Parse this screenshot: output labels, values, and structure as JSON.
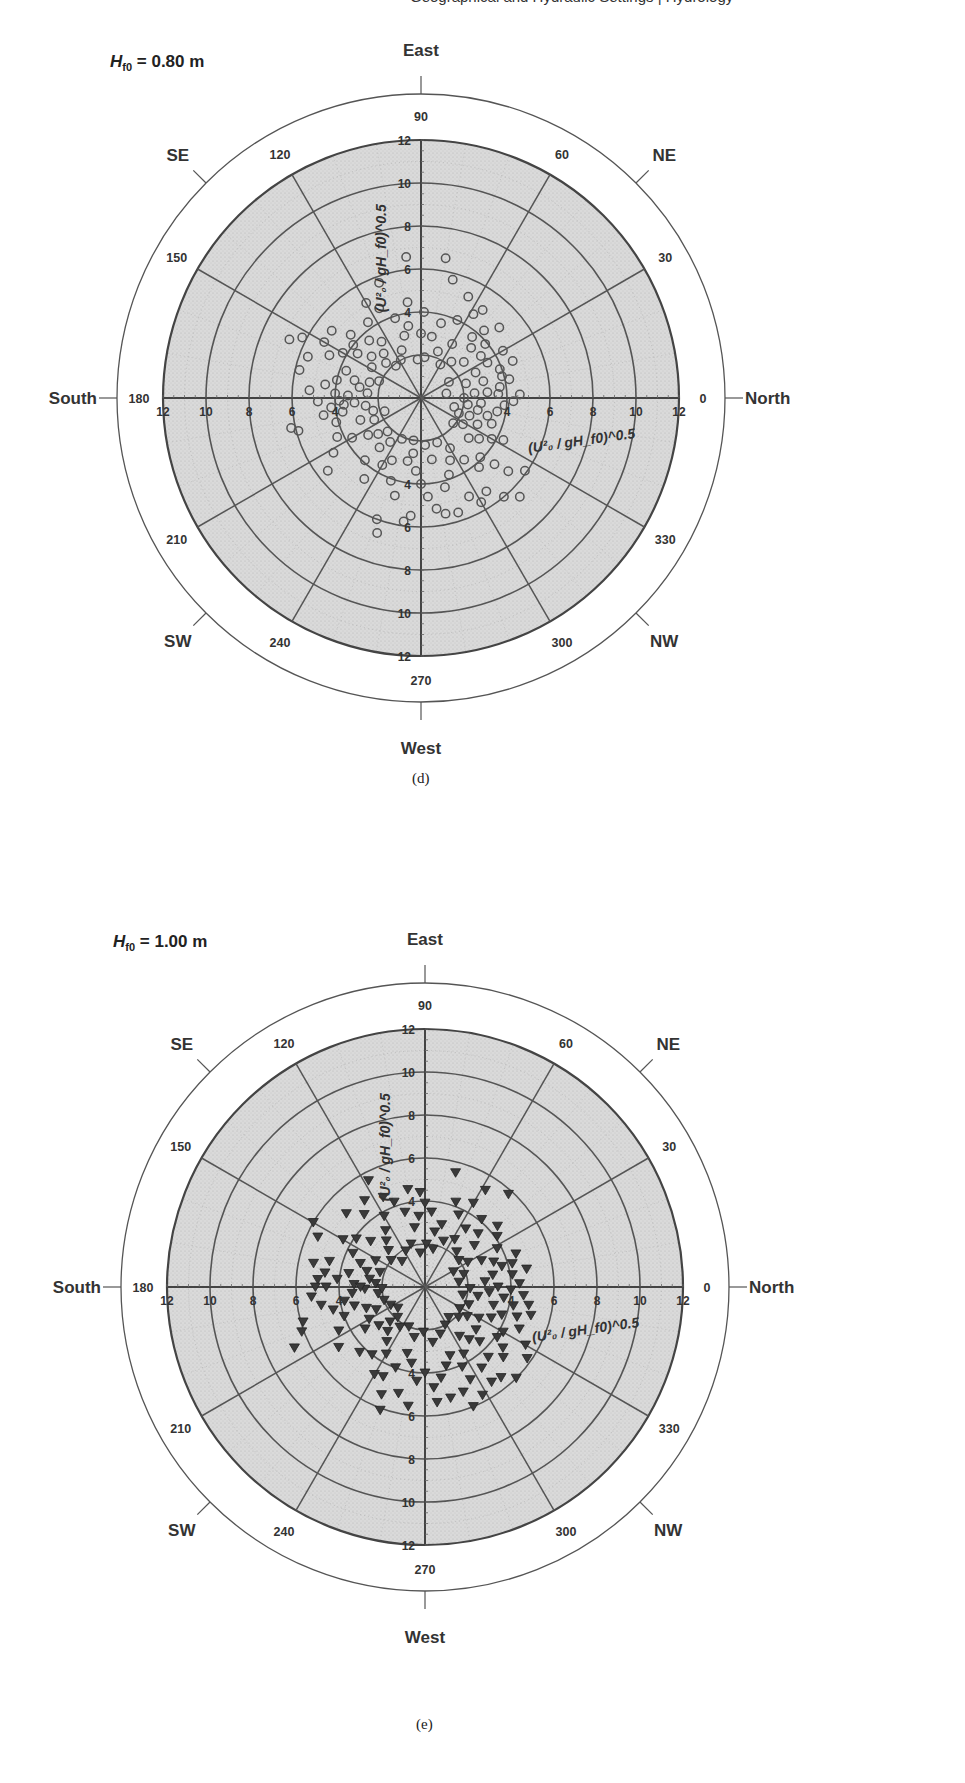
{
  "page": {
    "header_fragment": "Geographical and Hydraulic Settings | Hydrology"
  },
  "chart_data": [
    {
      "type": "scatter",
      "subtype": "polar",
      "panel_label": "(d)",
      "title": "H_f0 = 0.80 m",
      "title_parts": {
        "symbol": "H",
        "subscript": "f0",
        "rest": " = 0.80 m"
      },
      "radial_axis_label": "(U²₀ / gH_f0)^0.5",
      "radial_ticks": [
        2,
        4,
        6,
        8,
        10,
        12
      ],
      "radial_tick_labels_shown": [
        "4",
        "6",
        "8",
        "10",
        "12"
      ],
      "rlim": [
        0,
        12
      ],
      "angle_ticks": [
        0,
        30,
        60,
        90,
        120,
        150,
        180,
        210,
        240,
        270,
        300,
        330
      ],
      "compass": {
        "0": "North",
        "45": "NE",
        "90": "East",
        "135": "SE",
        "180": "South",
        "225": "SW",
        "270": "West",
        "315": "NW"
      },
      "marker": "open-circle",
      "marker_color": "#555555",
      "grid": true,
      "points": [
        [
          12,
          4.2
        ],
        [
          20,
          3.9
        ],
        [
          8,
          3.7
        ],
        [
          28,
          3.5
        ],
        [
          35,
          3.4
        ],
        [
          45,
          3.3
        ],
        [
          3,
          3.6
        ],
        [
          15,
          3.0
        ],
        [
          25,
          2.8
        ],
        [
          5,
          2.5
        ],
        [
          40,
          2.6
        ],
        [
          50,
          2.2
        ],
        [
          60,
          1.8
        ],
        [
          30,
          1.5
        ],
        [
          10,
          1.2
        ],
        [
          18,
          2.2
        ],
        [
          55,
          5.0
        ],
        [
          47,
          4.3
        ],
        [
          58,
          4.6
        ],
        [
          65,
          5.2
        ],
        [
          75,
          3.6
        ],
        [
          80,
          2.9
        ],
        [
          70,
          2.3
        ],
        [
          85,
          1.9
        ],
        [
          95,
          1.8
        ],
        [
          90,
          3.0
        ],
        [
          100,
          3.4
        ],
        [
          108,
          3.9
        ],
        [
          115,
          4.6
        ],
        [
          120,
          5.1
        ],
        [
          125,
          3.2
        ],
        [
          130,
          2.7
        ],
        [
          88,
          4.0
        ],
        [
          98,
          4.5
        ],
        [
          105,
          3.0
        ],
        [
          112,
          2.4
        ],
        [
          118,
          2.0
        ],
        [
          128,
          1.9
        ],
        [
          135,
          2.3
        ],
        [
          140,
          3.0
        ],
        [
          145,
          3.6
        ],
        [
          150,
          4.2
        ],
        [
          155,
          4.7
        ],
        [
          160,
          3.7
        ],
        [
          165,
          3.2
        ],
        [
          170,
          2.9
        ],
        [
          175,
          2.5
        ],
        [
          178,
          3.4
        ],
        [
          132,
          3.6
        ],
        [
          138,
          4.4
        ],
        [
          143,
          5.2
        ],
        [
          148,
          2.7
        ],
        [
          158,
          2.1
        ],
        [
          163,
          2.5
        ],
        [
          168,
          4.0
        ],
        [
          172,
          4.5
        ],
        [
          176,
          5.2
        ],
        [
          182,
          4.8
        ],
        [
          186,
          4.2
        ],
        [
          190,
          3.7
        ],
        [
          184,
          3.1
        ],
        [
          188,
          2.6
        ],
        [
          195,
          2.3
        ],
        [
          200,
          3.0
        ],
        [
          156,
          6.7
        ],
        [
          167,
          5.8
        ],
        [
          195,
          5.9
        ],
        [
          193,
          6.2
        ],
        [
          205,
          4.3
        ],
        [
          210,
          3.7
        ],
        [
          215,
          3.0
        ],
        [
          220,
          2.6
        ],
        [
          225,
          2.2
        ],
        [
          230,
          3.0
        ],
        [
          212,
          4.8
        ],
        [
          218,
          5.5
        ],
        [
          228,
          3.9
        ],
        [
          235,
          4.6
        ],
        [
          240,
          3.6
        ],
        [
          245,
          3.2
        ],
        [
          250,
          4.1
        ],
        [
          255,
          4.7
        ],
        [
          258,
          3.0
        ],
        [
          262,
          2.6
        ],
        [
          266,
          3.4
        ],
        [
          270,
          4.0
        ],
        [
          274,
          4.6
        ],
        [
          278,
          5.2
        ],
        [
          265,
          5.5
        ],
        [
          262,
          5.8
        ],
        [
          250,
          6.0
        ],
        [
          252,
          6.6
        ],
        [
          285,
          4.3
        ],
        [
          290,
          3.8
        ],
        [
          295,
          3.2
        ],
        [
          300,
          2.7
        ],
        [
          305,
          3.5
        ],
        [
          310,
          4.2
        ],
        [
          315,
          3.9
        ],
        [
          318,
          4.6
        ],
        [
          320,
          2.9
        ],
        [
          325,
          3.3
        ],
        [
          330,
          3.8
        ],
        [
          335,
          2.9
        ],
        [
          340,
          2.4
        ],
        [
          345,
          3.2
        ],
        [
          350,
          3.6
        ],
        [
          355,
          3.9
        ],
        [
          358,
          4.3
        ],
        [
          352,
          2.2
        ],
        [
          345,
          1.6
        ],
        [
          338,
          1.9
        ],
        [
          305,
          5.3
        ],
        [
          310,
          6.0
        ],
        [
          315,
          6.5
        ],
        [
          320,
          5.3
        ],
        [
          325,
          5.9
        ],
        [
          300,
          5.6
        ],
        [
          296,
          5.1
        ],
        [
          288,
          5.6
        ],
        [
          282,
          5.5
        ],
        [
          0,
          2.0
        ],
        [
          5,
          3.1
        ],
        [
          348,
          2.7
        ],
        [
          340,
          3.5
        ],
        [
          333,
          4.3
        ],
        [
          328,
          2.3
        ],
        [
          322,
          1.9
        ],
        [
          80,
          6.6
        ],
        [
          75,
          5.7
        ],
        [
          65,
          4.0
        ],
        [
          40,
          3.9
        ],
        [
          22,
          4.6
        ],
        [
          15,
          3.9
        ],
        [
          2,
          4.6
        ],
        [
          355,
          2.8
        ],
        [
          290,
          2.2
        ],
        [
          280,
          2.9
        ],
        [
          275,
          2.2
        ],
        [
          260,
          2.0
        ],
        [
          245,
          2.1
        ],
        [
          235,
          2.5
        ],
        [
          205,
          2.4
        ],
        [
          200,
          1.8
        ],
        [
          150,
          5.2
        ],
        [
          153,
          6.2
        ],
        [
          160,
          5.6
        ],
        [
          177,
          4.0
        ],
        [
          182,
          3.8
        ],
        [
          185,
          3.6
        ],
        [
          190,
          4.6
        ],
        [
          196,
          4.1
        ],
        [
          142,
          4.0
        ],
        [
          125,
          4.3
        ],
        [
          110,
          5.7
        ],
        [
          96,
          6.6
        ],
        [
          60,
          2.9
        ],
        [
          50,
          3.7
        ],
        [
          42,
          4.9
        ],
        [
          30,
          4.4
        ]
      ]
    },
    {
      "type": "scatter",
      "subtype": "polar",
      "panel_label": "(e)",
      "title": "H_f0 = 1.00 m",
      "title_parts": {
        "symbol": "H",
        "subscript": "f0",
        "rest": " = 1.00 m"
      },
      "radial_axis_label": "(U²₀ / gH_f0)^0.5",
      "radial_ticks": [
        2,
        4,
        6,
        8,
        10,
        12
      ],
      "radial_tick_labels_shown": [
        "4",
        "6",
        "8",
        "10",
        "12"
      ],
      "rlim": [
        0,
        12
      ],
      "angle_ticks": [
        0,
        30,
        60,
        90,
        120,
        150,
        180,
        210,
        240,
        270,
        300,
        330
      ],
      "compass": {
        "0": "North",
        "45": "NE",
        "90": "East",
        "135": "SE",
        "180": "South",
        "225": "SW",
        "270": "West",
        "315": "NW"
      },
      "marker": "filled-down-triangle",
      "marker_color": "#3a3a3a",
      "grid": true,
      "points": [
        [
          60,
          4.5
        ],
        [
          50,
          4.1
        ],
        [
          45,
          3.5
        ],
        [
          40,
          3.0
        ],
        [
          55,
          3.3
        ],
        [
          65,
          3.7
        ],
        [
          70,
          4.2
        ],
        [
          75,
          3.0
        ],
        [
          80,
          2.6
        ],
        [
          85,
          3.5
        ],
        [
          90,
          3.9
        ],
        [
          95,
          3.3
        ],
        [
          100,
          2.8
        ],
        [
          105,
          3.6
        ],
        [
          110,
          4.2
        ],
        [
          115,
          4.6
        ],
        [
          120,
          3.8
        ],
        [
          125,
          3.2
        ],
        [
          130,
          2.8
        ],
        [
          135,
          2.4
        ],
        [
          140,
          3.3
        ],
        [
          145,
          3.9
        ],
        [
          150,
          4.4
        ],
        [
          155,
          3.7
        ],
        [
          160,
          3.2
        ],
        [
          165,
          2.8
        ],
        [
          170,
          3.6
        ],
        [
          175,
          4.1
        ],
        [
          178,
          3.3
        ],
        [
          172,
          2.6
        ],
        [
          162,
          2.2
        ],
        [
          152,
          2.6
        ],
        [
          142,
          2.0
        ],
        [
          132,
          1.6
        ],
        [
          118,
          1.9
        ],
        [
          108,
          2.1
        ],
        [
          98,
          1.6
        ],
        [
          88,
          2.0
        ],
        [
          78,
          1.8
        ],
        [
          68,
          2.3
        ],
        [
          58,
          2.6
        ],
        [
          48,
          2.2
        ],
        [
          38,
          2.0
        ],
        [
          30,
          2.3
        ],
        [
          25,
          2.9
        ],
        [
          20,
          3.4
        ],
        [
          15,
          3.7
        ],
        [
          10,
          3.2
        ],
        [
          5,
          2.8
        ],
        [
          0,
          3.4
        ],
        [
          355,
          3.0
        ],
        [
          350,
          2.5
        ],
        [
          345,
          3.3
        ],
        [
          340,
          3.8
        ],
        [
          335,
          3.4
        ],
        [
          330,
          2.9
        ],
        [
          325,
          2.4
        ],
        [
          320,
          3.1
        ],
        [
          315,
          3.6
        ],
        [
          310,
          3.2
        ],
        [
          305,
          2.8
        ],
        [
          300,
          3.6
        ],
        [
          295,
          4.1
        ],
        [
          290,
          3.4
        ],
        [
          285,
          3.8
        ],
        [
          280,
          4.3
        ],
        [
          275,
          4.7
        ],
        [
          270,
          4.0
        ],
        [
          265,
          4.4
        ],
        [
          260,
          3.6
        ],
        [
          255,
          3.2
        ],
        [
          250,
          4.0
        ],
        [
          245,
          4.6
        ],
        [
          240,
          3.6
        ],
        [
          235,
          3.1
        ],
        [
          230,
          2.7
        ],
        [
          225,
          2.3
        ],
        [
          220,
          2.8
        ],
        [
          215,
          3.4
        ],
        [
          210,
          3.0
        ],
        [
          205,
          2.5
        ],
        [
          200,
          2.9
        ],
        [
          195,
          3.4
        ],
        [
          190,
          3.8
        ],
        [
          185,
          3.4
        ],
        [
          182,
          2.8
        ],
        [
          188,
          2.2
        ],
        [
          198,
          2.0
        ],
        [
          208,
          1.8
        ],
        [
          218,
          1.6
        ],
        [
          228,
          1.9
        ],
        [
          238,
          2.2
        ],
        [
          248,
          2.0
        ],
        [
          258,
          2.4
        ],
        [
          268,
          2.1
        ],
        [
          278,
          2.6
        ],
        [
          288,
          2.3
        ],
        [
          298,
          2.0
        ],
        [
          308,
          1.8
        ],
        [
          318,
          2.1
        ],
        [
          328,
          1.9
        ],
        [
          338,
          2.2
        ],
        [
          348,
          1.8
        ],
        [
          358,
          2.1
        ],
        [
          8,
          1.6
        ],
        [
          18,
          1.9
        ],
        [
          28,
          1.5
        ],
        [
          358,
          4.0
        ],
        [
          352,
          3.7
        ],
        [
          2,
          4.4
        ],
        [
          355,
          4.6
        ],
        [
          8,
          4.1
        ],
        [
          348,
          4.2
        ],
        [
          342,
          4.5
        ],
        [
          336,
          4.8
        ],
        [
          330,
          4.2
        ],
        [
          322,
          4.6
        ],
        [
          318,
          4.9
        ],
        [
          312,
          4.4
        ],
        [
          305,
          4.6
        ],
        [
          296,
          4.8
        ],
        [
          290,
          5.2
        ],
        [
          283,
          5.3
        ],
        [
          276,
          5.4
        ],
        [
          262,
          5.6
        ],
        [
          256,
          5.1
        ],
        [
          248,
          5.4
        ],
        [
          250,
          6.1
        ],
        [
          165,
          4.6
        ],
        [
          168,
          5.3
        ],
        [
          172,
          4.7
        ],
        [
          176,
          5.0
        ],
        [
          180,
          4.6
        ],
        [
          185,
          5.3
        ],
        [
          190,
          4.9
        ],
        [
          194,
          4.4
        ],
        [
          200,
          4.0
        ],
        [
          207,
          4.5
        ],
        [
          215,
          4.9
        ],
        [
          225,
          4.3
        ],
        [
          232,
          4.0
        ],
        [
          240,
          4.7
        ],
        [
          155,
          5.5
        ],
        [
          150,
          6.0
        ],
        [
          130,
          4.4
        ],
        [
          137,
          5.0
        ],
        [
          125,
          4.9
        ],
        [
          118,
          5.6
        ],
        [
          100,
          4.6
        ],
        [
          93,
          4.4
        ],
        [
          75,
          5.5
        ],
        [
          58,
          5.3
        ],
        [
          48,
          5.8
        ],
        [
          40,
          4.4
        ],
        [
          35,
          4.1
        ],
        [
          28,
          3.8
        ],
        [
          20,
          4.5
        ],
        [
          15,
          4.2
        ],
        [
          10,
          4.8
        ],
        [
          330,
          5.4
        ],
        [
          325,
          5.8
        ],
        [
          315,
          6.0
        ],
        [
          310,
          5.5
        ],
        [
          305,
          5.4
        ],
        [
          180,
          5.1
        ],
        [
          196,
          5.9
        ],
        [
          200,
          6.1
        ],
        [
          205,
          6.7
        ],
        [
          180,
          3.0
        ],
        [
          176,
          2.3
        ],
        [
          182,
          2.0
        ],
        [
          350,
          4.9
        ],
        [
          345,
          5.1
        ],
        [
          325,
          4.1
        ],
        [
          298,
          5.7
        ],
        [
          292,
          6.0
        ]
      ]
    }
  ]
}
